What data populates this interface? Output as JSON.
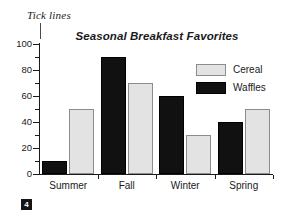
{
  "annotation": {
    "label": "Tick lines"
  },
  "badge": {
    "number": "4"
  },
  "legend": {
    "position": "inside-top-right",
    "entries": [
      {
        "label": "Cereal",
        "color": "#e3e3e3"
      },
      {
        "label": "Waffles",
        "color": "#111111"
      }
    ]
  },
  "chart_data": {
    "type": "bar",
    "title": "Seasonal Breakfast Favorites",
    "xlabel": "",
    "ylabel": "",
    "categories": [
      "Summer",
      "Fall",
      "Winter",
      "Spring"
    ],
    "series": [
      {
        "name": "Waffles",
        "color": "#111111",
        "values": [
          10,
          90,
          60,
          40
        ]
      },
      {
        "name": "Cereal",
        "color": "#e3e3e3",
        "values": [
          50,
          70,
          30,
          50
        ]
      }
    ],
    "series_draw_order": [
      "Waffles",
      "Cereal"
    ],
    "ylim": [
      0,
      100
    ],
    "ytick_labels": [
      "0",
      "20",
      "40",
      "60",
      "80",
      "100"
    ],
    "ytick_values": [
      0,
      20,
      40,
      60,
      80,
      100
    ],
    "yminor_values": [
      10,
      30,
      50,
      70,
      90
    ],
    "grid": false,
    "axes": {
      "y_axis_visible": true,
      "x_axis_visible": true,
      "tick_direction": "out"
    }
  }
}
